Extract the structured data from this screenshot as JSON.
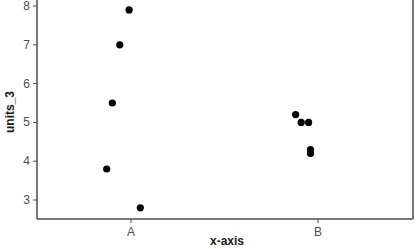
{
  "chart_data": {
    "type": "scatter",
    "title": "",
    "xlabel": "x-axis",
    "ylabel": "units_3",
    "categories": [
      "A",
      "B"
    ],
    "yticks": [
      3,
      4,
      5,
      6,
      7,
      8
    ],
    "ylim": [
      2.5,
      8.05
    ],
    "grid": false,
    "legend": null,
    "points": [
      {
        "category": "A",
        "jitter": -0.01,
        "y": 7.9
      },
      {
        "category": "A",
        "jitter": -0.06,
        "y": 7.0
      },
      {
        "category": "A",
        "jitter": -0.1,
        "y": 5.5
      },
      {
        "category": "A",
        "jitter": -0.13,
        "y": 3.8
      },
      {
        "category": "A",
        "jitter": 0.05,
        "y": 2.8
      },
      {
        "category": "B",
        "jitter": -0.12,
        "y": 5.2
      },
      {
        "category": "B",
        "jitter": -0.09,
        "y": 5.0
      },
      {
        "category": "B",
        "jitter": -0.05,
        "y": 5.0
      },
      {
        "category": "B",
        "jitter": -0.04,
        "y": 4.3
      },
      {
        "category": "B",
        "jitter": -0.04,
        "y": 4.2
      }
    ],
    "colors": {
      "point": "#000000",
      "axis": "#4d4d4d",
      "background": "#ffffff"
    }
  }
}
